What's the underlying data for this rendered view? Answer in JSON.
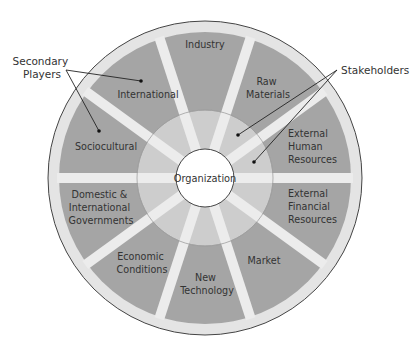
{
  "diagram": {
    "center": {
      "label": "Organization"
    },
    "segments": [
      {
        "lines": [
          "Industry"
        ]
      },
      {
        "lines": [
          "International"
        ]
      },
      {
        "lines": [
          "Sociocultural"
        ]
      },
      {
        "lines": [
          "Domestic &",
          "International",
          "Governments"
        ]
      },
      {
        "lines": [
          "Economic",
          "Conditions"
        ]
      },
      {
        "lines": [
          "New",
          "Technology"
        ]
      },
      {
        "lines": [
          "Market"
        ]
      },
      {
        "lines": [
          "External",
          "Financial",
          "Resources"
        ]
      },
      {
        "lines": [
          "External",
          "Human",
          "Resources"
        ]
      },
      {
        "lines": [
          "Raw",
          "Materials"
        ]
      }
    ],
    "callouts": {
      "secondary": {
        "lines": [
          "Secondary",
          "Players"
        ]
      },
      "stakeholders": {
        "label": "Stakeholders"
      }
    },
    "colors": {
      "outer_rim": "#e4e4e4",
      "segment": "#a5a5a5",
      "inner_ring": "#cdcdcd",
      "spoke": "#ececec",
      "center_fill": "#ffffff",
      "stroke": "#444444"
    }
  }
}
